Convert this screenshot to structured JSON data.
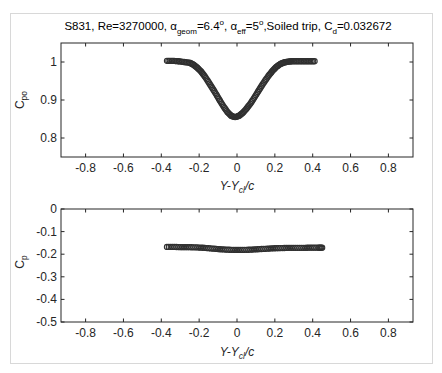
{
  "figure": {
    "title": {
      "prefix": "S831, Re=3270000, ",
      "alpha": "α",
      "geom_sub": "geom",
      "geom_val": "=6.4",
      "deg": "o",
      "sep1": ", ",
      "eff_sub": "eff",
      "eff_val": "=5",
      "trip": ",Soiled trip, C",
      "cd_sub": "d",
      "cd_val": "=0.032672"
    }
  },
  "chart_data": [
    {
      "type": "scatter",
      "title": "S831, Re=3270000, α_geom=6.4°, α_eff=5°, Soiled trip, C_d=0.032672",
      "xlabel": "Y-Y_cl/c",
      "ylabel": "C_po",
      "xlim": [
        -0.93,
        0.93
      ],
      "ylim": [
        0.75,
        1.05
      ],
      "xticks": [
        -0.8,
        -0.6,
        -0.4,
        -0.2,
        0,
        0.2,
        0.4,
        0.6,
        0.8
      ],
      "xtick_labels": [
        "-0.8",
        "-0.6",
        "-0.4",
        "-0.2",
        "0",
        "0.2",
        "0.4",
        "0.6",
        "0.8"
      ],
      "yticks": [
        0.8,
        0.9,
        1
      ],
      "ytick_labels": [
        "0.8",
        "0.9",
        "1"
      ],
      "grid": false,
      "marker": "circle",
      "series": [
        {
          "name": "C_po",
          "x": [
            -0.37,
            -0.34,
            -0.31,
            -0.28,
            -0.25,
            -0.23,
            -0.21,
            -0.19,
            -0.17,
            -0.15,
            -0.13,
            -0.11,
            -0.09,
            -0.07,
            -0.05,
            -0.03,
            -0.01,
            0.01,
            0.03,
            0.05,
            0.07,
            0.09,
            0.11,
            0.13,
            0.15,
            0.17,
            0.19,
            0.21,
            0.23,
            0.25,
            0.27,
            0.29,
            0.32,
            0.35,
            0.38,
            0.41
          ],
          "y": [
            1.003,
            1.003,
            1.002,
            1.0,
            0.998,
            0.993,
            0.985,
            0.975,
            0.962,
            0.947,
            0.931,
            0.915,
            0.898,
            0.882,
            0.868,
            0.858,
            0.855,
            0.858,
            0.866,
            0.877,
            0.89,
            0.905,
            0.921,
            0.937,
            0.952,
            0.966,
            0.978,
            0.988,
            0.995,
            0.999,
            1.001,
            1.002,
            1.002,
            1.002,
            1.002,
            1.002
          ]
        }
      ]
    },
    {
      "type": "scatter",
      "title": "",
      "xlabel": "Y-Y_cl/c",
      "ylabel": "C_p",
      "xlim": [
        -0.93,
        0.93
      ],
      "ylim": [
        -0.5,
        0
      ],
      "xticks": [
        -0.8,
        -0.6,
        -0.4,
        -0.2,
        0,
        0.2,
        0.4,
        0.6,
        0.8
      ],
      "xtick_labels": [
        "-0.8",
        "-0.6",
        "-0.4",
        "-0.2",
        "0",
        "0.2",
        "0.4",
        "0.6",
        "0.8"
      ],
      "yticks": [
        0,
        -0.1,
        -0.2,
        -0.3,
        -0.4,
        -0.5
      ],
      "ytick_labels": [
        "0",
        "-0.1",
        "-0.2",
        "-0.3",
        "-0.4",
        "-0.5"
      ],
      "grid": false,
      "marker": "circle",
      "series": [
        {
          "name": "C_p",
          "x": [
            -0.37,
            -0.33,
            -0.29,
            -0.25,
            -0.21,
            -0.17,
            -0.13,
            -0.09,
            -0.05,
            -0.01,
            0.03,
            0.07,
            0.11,
            0.15,
            0.19,
            0.23,
            0.27,
            0.31,
            0.35,
            0.39,
            0.43,
            0.45
          ],
          "y": [
            -0.168,
            -0.168,
            -0.169,
            -0.169,
            -0.17,
            -0.172,
            -0.175,
            -0.178,
            -0.18,
            -0.181,
            -0.181,
            -0.18,
            -0.178,
            -0.176,
            -0.174,
            -0.173,
            -0.172,
            -0.172,
            -0.172,
            -0.171,
            -0.171,
            -0.171
          ]
        }
      ]
    }
  ],
  "labels": {
    "top_ylabel_main": "C",
    "top_ylabel_sub": "po",
    "bottom_ylabel_main": "C",
    "bottom_ylabel_sub": "p",
    "xlabel_main": "Y-Y",
    "xlabel_sub": "cl",
    "xlabel_tail": "/c"
  }
}
